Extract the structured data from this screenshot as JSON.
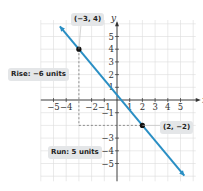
{
  "chart_data": {
    "type": "line",
    "title": "",
    "xlabel": "x",
    "ylabel": "y",
    "xlim": [
      -6,
      6
    ],
    "ylim": [
      -6,
      6
    ],
    "grid": true,
    "x_ticks": [
      "-5",
      "-4",
      "-2",
      "-1",
      "1",
      "2",
      "3",
      "4",
      "5"
    ],
    "y_ticks": [
      "5",
      "4",
      "3",
      "2",
      "1",
      "-1",
      "-3",
      "-4",
      "-5"
    ],
    "line": {
      "slope": -1.2,
      "through": [
        [
          -3,
          4
        ],
        [
          2,
          -2
        ]
      ],
      "color": "#2a8fc4"
    },
    "points": [
      {
        "label": "(−3, 4)",
        "x": -3,
        "y": 4
      },
      {
        "label": "(2, −2)",
        "x": 2,
        "y": -2
      }
    ],
    "annotations": [
      {
        "text": "Rise: −6 units"
      },
      {
        "text": "Run: 5 units"
      }
    ]
  },
  "labels": {
    "point1": "(−3, 4)",
    "point2": "(2, −2)",
    "rise": "Rise: −6 units",
    "run": "Run: 5 units",
    "x_axis": "x",
    "y_axis": "y"
  },
  "ticks": {
    "x": [
      {
        "t": "−5",
        "v": -5
      },
      {
        "t": "−4",
        "v": -4
      },
      {
        "t": "−2",
        "v": -2
      },
      {
        "t": "−1",
        "v": -1
      },
      {
        "t": "1",
        "v": 1
      },
      {
        "t": "2",
        "v": 2
      },
      {
        "t": "3",
        "v": 3
      },
      {
        "t": "4",
        "v": 4
      },
      {
        "t": "5",
        "v": 5
      }
    ],
    "y": [
      {
        "t": "5",
        "v": 5
      },
      {
        "t": "4",
        "v": 4
      },
      {
        "t": "3",
        "v": 3
      },
      {
        "t": "2",
        "v": 2
      },
      {
        "t": "1",
        "v": 1
      },
      {
        "t": "−1",
        "v": -1
      },
      {
        "t": "−3",
        "v": -3
      },
      {
        "t": "−4",
        "v": -4
      },
      {
        "t": "−5",
        "v": -5
      }
    ]
  },
  "colors": {
    "line": "#2a8fc4",
    "grid": "#dcdcdc",
    "axis": "#333333",
    "label_bg": "#e4e6e8"
  }
}
